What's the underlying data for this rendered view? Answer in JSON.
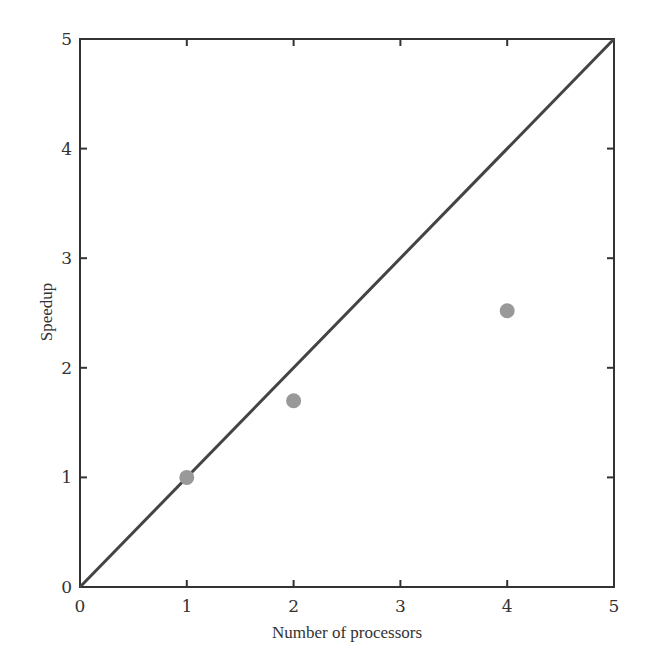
{
  "chart_data": {
    "type": "scatter",
    "title": "",
    "xlabel": "Number of processors",
    "ylabel": "Speedup",
    "xlim": [
      0,
      5
    ],
    "ylim": [
      0,
      5
    ],
    "x_ticks": [
      "0",
      "1",
      "2",
      "3",
      "4",
      "5"
    ],
    "y_ticks": [
      "0",
      "1",
      "2",
      "3",
      "4",
      "5"
    ],
    "grid": false,
    "legend": null,
    "series": [
      {
        "name": "Measured speedup",
        "type": "scatter",
        "x": [
          1,
          2,
          4
        ],
        "y": [
          1.0,
          1.7,
          2.52
        ],
        "color": "#999999"
      },
      {
        "name": "Ideal (linear) speedup",
        "type": "line",
        "x": [
          0,
          5
        ],
        "y": [
          0,
          5
        ],
        "color": "#444444"
      }
    ]
  },
  "colors": {
    "frame": "#333333",
    "line": "#444444",
    "points": "#999999"
  }
}
